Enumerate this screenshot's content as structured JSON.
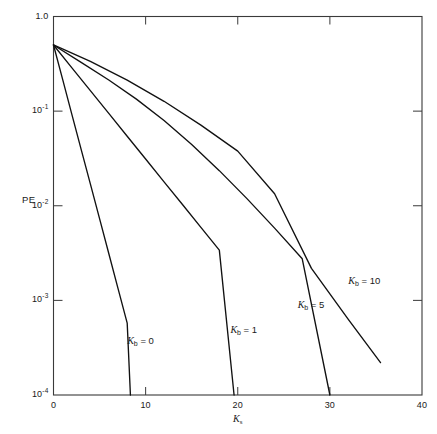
{
  "chart_data": {
    "type": "line",
    "title": "",
    "xlabel": "K_s",
    "xlabel_base": "K",
    "xlabel_sub": "s",
    "ylabel": "PE",
    "xlim": [
      0,
      40
    ],
    "ylim": [
      0.0001,
      1.0
    ],
    "yscale": "log",
    "grid": false,
    "legend": "inline-annotations",
    "xticks": [
      0,
      10,
      20,
      30,
      40
    ],
    "xtick_labels": [
      "0",
      "10",
      "20",
      "30",
      "40"
    ],
    "yticks": [
      1.0,
      0.1,
      0.01,
      0.001,
      0.0001
    ],
    "ytick_labels": [
      "1.0",
      "10-1",
      "10-2",
      "10-3",
      "10-4"
    ],
    "ytick_mantissa": [
      "1.0",
      "10",
      "10",
      "10",
      "10"
    ],
    "ytick_exponent": [
      "",
      "-1",
      "-2",
      "-3",
      "-4"
    ],
    "series": [
      {
        "name": "Kb = 0",
        "label_base": "K",
        "label_sub": "b",
        "label_value": "= 0",
        "label_x": 8.0,
        "label_y": 0.00036,
        "points": [
          [
            0,
            0.5
          ],
          [
            1,
            0.215
          ],
          [
            2,
            0.092
          ],
          [
            3,
            0.0395
          ],
          [
            4,
            0.017
          ],
          [
            5,
            0.0073
          ],
          [
            6,
            0.00313
          ],
          [
            7,
            0.00134
          ],
          [
            8,
            0.000575
          ],
          [
            8.35,
            0.0001
          ]
        ]
      },
      {
        "name": "Kb = 1",
        "label_base": "K",
        "label_sub": "b",
        "label_value": "= 1",
        "label_x": 19.2,
        "label_y": 0.00047,
        "points": [
          [
            0,
            0.5
          ],
          [
            2,
            0.287
          ],
          [
            4,
            0.165
          ],
          [
            6,
            0.0945
          ],
          [
            8,
            0.0543
          ],
          [
            10,
            0.0312
          ],
          [
            12,
            0.0179
          ],
          [
            14,
            0.0103
          ],
          [
            16,
            0.0059
          ],
          [
            18,
            0.0034
          ],
          [
            19.6,
            0.0001
          ]
        ]
      },
      {
        "name": "Kb = 5",
        "label_base": "K",
        "label_sub": "b",
        "label_value": "= 5",
        "label_x": 26.5,
        "label_y": 0.00088,
        "points": [
          [
            0,
            0.5
          ],
          [
            3,
            0.328
          ],
          [
            6,
            0.213
          ],
          [
            9,
            0.134
          ],
          [
            12,
            0.0795
          ],
          [
            15,
            0.0443
          ],
          [
            18,
            0.0235
          ],
          [
            21,
            0.0119
          ],
          [
            24,
            0.0058
          ],
          [
            27,
            0.00275
          ],
          [
            30,
            0.0001
          ]
        ]
      },
      {
        "name": "Kb = 10",
        "label_base": "K",
        "label_sub": "b",
        "label_value": "= 10",
        "label_x": 32.0,
        "label_y": 0.00155,
        "points": [
          [
            0,
            0.5
          ],
          [
            4,
            0.336
          ],
          [
            8,
            0.213
          ],
          [
            12,
            0.127
          ],
          [
            16,
            0.0712
          ],
          [
            20,
            0.0378
          ],
          [
            24,
            0.0134
          ],
          [
            28,
            0.00218
          ],
          [
            32,
            0.00063
          ],
          [
            35.5,
            0.00022
          ]
        ]
      }
    ]
  },
  "axis": {
    "y_label_text": "PE"
  },
  "style": {
    "line_color": "#111111",
    "frame_color": "#3a3a3a",
    "background": "#ffffff"
  }
}
